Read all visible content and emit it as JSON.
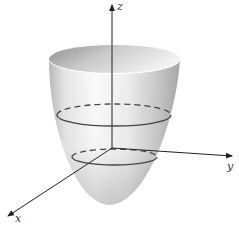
{
  "figure": {
    "colors": {
      "background": "#ffffff",
      "surface_light": "#f4f4f4",
      "surface_dark": "#9a9a9a",
      "axis": "#222222",
      "trace": "#444444"
    },
    "axes": {
      "z": {
        "label": "z"
      },
      "y": {
        "label": "y"
      },
      "x": {
        "label": "x"
      }
    },
    "traces": [
      {
        "name": "upper-cross-section",
        "style": "solid-front dashed-back"
      },
      {
        "name": "lower-cross-section",
        "style": "solid-front dashed-back"
      }
    ]
  }
}
